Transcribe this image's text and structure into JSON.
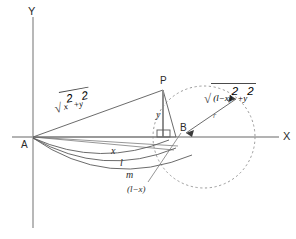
{
  "figure": {
    "background_color": "#ffffff",
    "line_color": "#4a4a4a",
    "axis_color": "#8c8c8c",
    "dash_color": "#9a9a9a",
    "text_color": "#2b2b2b",
    "width": 296,
    "height": 239
  },
  "axes": {
    "y_label": "Y",
    "x_label": "X"
  },
  "points": {
    "A": "A",
    "P": "P",
    "B": "B"
  },
  "labels": {
    "segment_y": "y",
    "curve_x": "x",
    "curve_l": "l",
    "curve_m": "m",
    "radius_r": "r",
    "base_offset": "(l−x)"
  },
  "expressions": {
    "left_radical": {
      "sign": "√",
      "term1": "x",
      "exp1": "2",
      "operator": "+",
      "term2": "y",
      "exp2": "2"
    },
    "right_radical": {
      "sign": "√",
      "term1": "(l−x)",
      "exp1": "2",
      "operator": "+",
      "term2": "y",
      "exp2": "2"
    }
  },
  "geometry": {
    "origin_A": [
      33,
      137
    ],
    "point_P": [
      163,
      90
    ],
    "point_B": [
      176,
      137
    ],
    "foot_of_P": [
      163,
      137
    ],
    "circle_center": [
      204,
      137
    ],
    "circle_radius": 51,
    "x_axis_end": [
      279,
      137
    ],
    "y_axis_top": [
      33,
      17
    ],
    "y_axis_bottom": [
      33,
      228
    ]
  }
}
